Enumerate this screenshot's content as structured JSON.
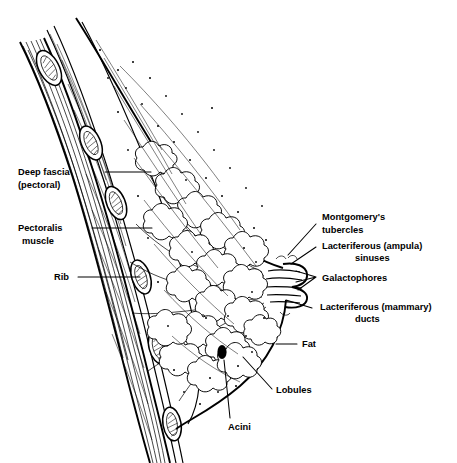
{
  "figure": {
    "name": "sagittal-section-of-the-breast",
    "style": "black-and-white line drawing",
    "width": 457,
    "height": 463,
    "background_color": "#ffffff",
    "ink_color": "#000000"
  },
  "labels": {
    "deep_fascia": {
      "line1": "Deep fascia",
      "line2": "(pectoral)"
    },
    "pectoralis": {
      "line1": "Pectoralis",
      "line2": "muscle"
    },
    "rib": {
      "line1": "Rib"
    },
    "montgomery": {
      "line1": "Montgomery's",
      "line2": "tubercles"
    },
    "sinuses": {
      "line1": "Lacteriferous (ampula)",
      "line2": "sinuses"
    },
    "galactophores": {
      "line1": "Galactophores"
    },
    "ducts": {
      "line1": "Lacteriferous (mammary)",
      "line2": "ducts"
    },
    "fat": {
      "line1": "Fat"
    },
    "lobules": {
      "line1": "Lobules"
    },
    "acini": {
      "line1": "Acini"
    }
  }
}
